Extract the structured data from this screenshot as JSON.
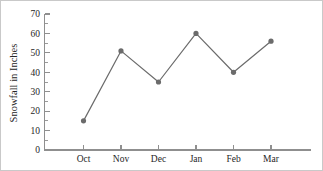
{
  "chart_data": {
    "type": "line",
    "title": "",
    "xlabel": "",
    "ylabel": "Snowfall in Inches",
    "categories": [
      "Oct",
      "Nov",
      "Dec",
      "Jan",
      "Feb",
      "Mar"
    ],
    "values": [
      15,
      51,
      35,
      60,
      40,
      56
    ],
    "series": [
      {
        "name": "Snowfall",
        "values": [
          15,
          51,
          35,
          60,
          40,
          56
        ]
      }
    ],
    "ylim": [
      0,
      70
    ],
    "yticks": [
      0,
      10,
      20,
      30,
      40,
      50,
      60,
      70
    ],
    "yticklabels": [
      "0",
      "10",
      "20",
      "30",
      "40",
      "50",
      "60",
      "70"
    ],
    "yminor_ticks": [
      5,
      15,
      25,
      35,
      45,
      55,
      65
    ],
    "grid": false,
    "legend": null,
    "tick_direction": "in",
    "colors": {
      "series": "#6b6b6b",
      "axis": "#8f8f8f",
      "text": "#262626",
      "background": "#ffffff",
      "border": "#c9c9c9"
    },
    "marker_radius": 2.6,
    "line_width": 1.2
  }
}
